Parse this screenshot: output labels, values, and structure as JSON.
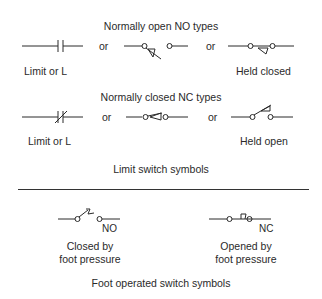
{
  "limit_switch": {
    "caption": "Limit switch symbols",
    "no_section": {
      "heading": "Normally open NO types",
      "separators": [
        "or",
        "or"
      ],
      "symbols": [
        {
          "icon": "contact-no-icon",
          "label": "Limit or L"
        },
        {
          "icon": "limit-switch-no-icon",
          "label": ""
        },
        {
          "icon": "limit-switch-no-held-closed-icon",
          "label": "Held closed"
        }
      ]
    },
    "nc_section": {
      "heading": "Normally closed NC types",
      "separators": [
        "or",
        "or"
      ],
      "symbols": [
        {
          "icon": "contact-nc-icon",
          "label": "Limit or L"
        },
        {
          "icon": "limit-switch-nc-icon",
          "label": ""
        },
        {
          "icon": "limit-switch-nc-held-open-icon",
          "label": "Held open"
        }
      ]
    }
  },
  "foot_switch": {
    "caption": "Foot operated switch symbols",
    "symbols": [
      {
        "icon": "foot-switch-no-icon",
        "tag": "NO",
        "label_line1": "Closed by",
        "label_line2": "foot pressure"
      },
      {
        "icon": "foot-switch-nc-icon",
        "tag": "NC",
        "label_line1": "Opened by",
        "label_line2": "foot pressure"
      }
    ]
  }
}
